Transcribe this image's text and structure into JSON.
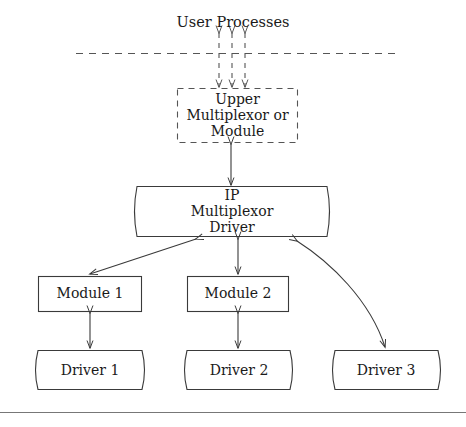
{
  "diagram": {
    "background_color": "#ffffff",
    "stroke_color": "#3a3a3a",
    "text_color": "#1a1a1a",
    "nodes": {
      "user_processes": {
        "label": "User Processes",
        "style": "plain-text"
      },
      "upper_mux": {
        "label_line1": "Upper",
        "label_line2": "Multiplexor or",
        "label_line3": "Module",
        "style": "dashed-rectangle"
      },
      "ip_mux_driver": {
        "label_line1": "IP",
        "label_line2": "Multiplexor",
        "label_line3": "Driver",
        "style": "bowed-rectangle"
      },
      "module1": {
        "label": "Module 1",
        "style": "rectangle"
      },
      "module2": {
        "label": "Module 2",
        "style": "rectangle"
      },
      "driver1": {
        "label": "Driver 1",
        "style": "bowed-rectangle"
      },
      "driver2": {
        "label": "Driver 2",
        "style": "bowed-rectangle"
      },
      "driver3": {
        "label": "Driver 3",
        "style": "bowed-rectangle"
      }
    },
    "connectors": {
      "user_to_upper": {
        "name": "triple-dashed-bidirectional",
        "count": 3
      },
      "upper_to_ip": {
        "name": "solid-bidirectional-vertical"
      },
      "ip_to_module1": {
        "name": "solid-bidirectional-diagonal"
      },
      "ip_to_module2": {
        "name": "solid-bidirectional-vertical"
      },
      "ip_to_driver3": {
        "name": "solid-bidirectional-curved"
      },
      "module1_to_driver1": {
        "name": "solid-bidirectional-vertical"
      },
      "module2_to_driver2": {
        "name": "solid-bidirectional-vertical"
      }
    },
    "kernel_boundary": {
      "name": "dashed-horizontal-divider"
    },
    "footer_rule": {
      "name": "solid-horizontal-rule"
    }
  }
}
